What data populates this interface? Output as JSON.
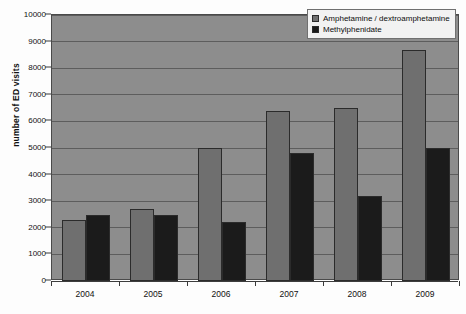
{
  "chart_data": {
    "type": "bar",
    "title": "",
    "subtitle": "",
    "xlabel": "",
    "ylabel": "number of ED visits",
    "categories": [
      "2004",
      "2005",
      "2006",
      "2007",
      "2008",
      "2009"
    ],
    "series": [
      {
        "name": "Amphetamine / dextroamphetamine",
        "color": "#6f6f6f",
        "values": [
          2300,
          2700,
          5000,
          6400,
          6500,
          8700
        ]
      },
      {
        "name": "Methylphenidate",
        "color": "#1b1b1b",
        "values": [
          2500,
          2500,
          2200,
          4800,
          3200,
          5000
        ]
      }
    ],
    "ylim": [
      0,
      10000
    ],
    "ytick_values": [
      0,
      1000,
      2000,
      3000,
      4000,
      5000,
      6000,
      7000,
      8000,
      9000,
      10000
    ],
    "ytick_labels": [
      "0",
      "1000",
      "2000",
      "3000",
      "4000",
      "5000",
      "6000",
      "7000",
      "8000",
      "9000",
      "10000"
    ],
    "grid": true,
    "legend_position": "top-right",
    "plot_background": "#8d8d8d",
    "gridline_color": "#5d5d5d",
    "figure_background": "#fdfdfd"
  }
}
